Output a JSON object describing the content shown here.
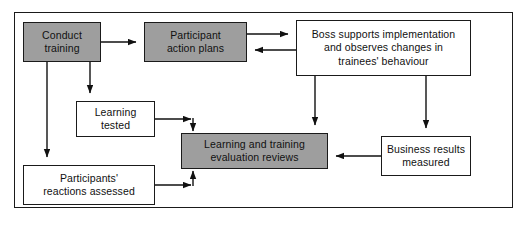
{
  "diagram": {
    "colors": {
      "shaded_fill": "#9e9e9e",
      "plain_fill": "#ffffff",
      "stroke": "#1a1a1a",
      "background": "#ffffff"
    },
    "frame": {
      "x": 14,
      "y": 12,
      "width": 499,
      "height": 196
    },
    "nodes": [
      {
        "id": "conduct-training",
        "label": "Conduct\ntraining",
        "style": "shaded",
        "x": 23,
        "y": 22,
        "width": 78,
        "height": 40
      },
      {
        "id": "participant-action-plans",
        "label": "Participant\naction plans",
        "style": "shaded",
        "x": 144,
        "y": 22,
        "width": 103,
        "height": 40
      },
      {
        "id": "boss-supports",
        "label": "Boss supports implementation\nand observes changes in\ntrainees' behaviour",
        "style": "plain",
        "x": 296,
        "y": 20,
        "width": 175,
        "height": 56
      },
      {
        "id": "learning-tested",
        "label": "Learning\ntested",
        "style": "plain",
        "x": 76,
        "y": 101,
        "width": 79,
        "height": 36
      },
      {
        "id": "learning-training-evaluation-reviews",
        "label": "Learning and training\nevaluation reviews",
        "style": "shaded",
        "x": 181,
        "y": 133,
        "width": 147,
        "height": 36
      },
      {
        "id": "business-results-measured",
        "label": "Business results\nmeasured",
        "style": "plain",
        "x": 381,
        "y": 136,
        "width": 90,
        "height": 40
      },
      {
        "id": "participants-reactions-assessed",
        "label": "Participants'\nreactions assessed",
        "style": "plain",
        "x": 23,
        "y": 165,
        "width": 132,
        "height": 40
      }
    ],
    "connectors": [
      {
        "id": "conduct-training-to-participant-action-plans",
        "from": "conduct-training",
        "to": "participant-action-plans",
        "direction": "right"
      },
      {
        "id": "participant-action-plans-to-boss-supports",
        "from": "participant-action-plans",
        "to": "boss-supports",
        "direction": "right"
      },
      {
        "id": "boss-supports-to-participant-action-plans",
        "from": "boss-supports",
        "to": "participant-action-plans",
        "direction": "left"
      },
      {
        "id": "conduct-training-to-learning-tested",
        "from": "conduct-training",
        "to": "learning-tested",
        "direction": "down"
      },
      {
        "id": "conduct-training-to-participants-reactions-assessed",
        "from": "conduct-training",
        "to": "participants-reactions-assessed",
        "direction": "down"
      },
      {
        "id": "learning-tested-to-evaluation-reviews",
        "from": "learning-tested",
        "to": "learning-training-evaluation-reviews",
        "direction": "right-then-down"
      },
      {
        "id": "participants-reactions-to-evaluation-reviews",
        "from": "participants-reactions-assessed",
        "to": "learning-training-evaluation-reviews",
        "direction": "right-then-up"
      },
      {
        "id": "boss-supports-to-evaluation-reviews",
        "from": "boss-supports",
        "to": "learning-training-evaluation-reviews",
        "direction": "down"
      },
      {
        "id": "boss-supports-to-business-results",
        "from": "boss-supports",
        "to": "business-results-measured",
        "direction": "down"
      },
      {
        "id": "business-results-to-evaluation-reviews",
        "from": "business-results-measured",
        "to": "learning-training-evaluation-reviews",
        "direction": "left"
      }
    ]
  }
}
